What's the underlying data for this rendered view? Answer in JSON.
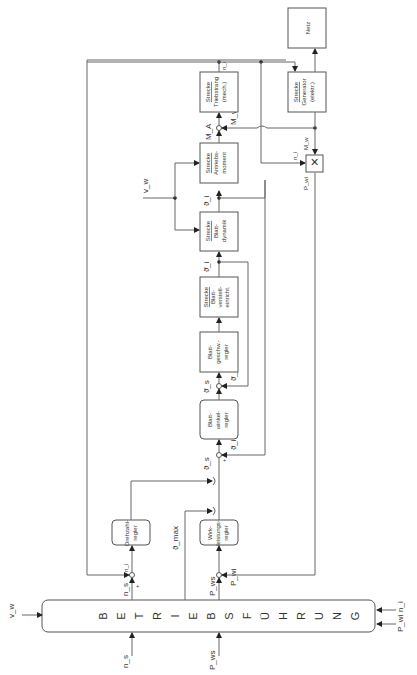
{
  "diagram": {
    "orientation": "rotated 90deg counter-clockwise",
    "operations_block": {
      "letters": [
        "B",
        "E",
        "T",
        "R",
        "I",
        "E",
        "B",
        "S",
        "F",
        "Ü",
        "H",
        "R",
        "U",
        "N",
        "G"
      ],
      "label": "BETRIEBSFÜHRUNG"
    },
    "blocks": {
      "drehzahlregler": [
        "Drehzahl-",
        "regler"
      ],
      "wirkleistungsregler": [
        "Wirk-",
        "leistungs-",
        "regler"
      ],
      "blattwinkelregler": [
        "Blatt-",
        "winkel-",
        "regler"
      ],
      "blattgeschwregler": [
        "Blatt-",
        "geschw.-",
        "regler"
      ],
      "strecke_blattverstell": [
        "Strecke",
        "Blatt-",
        "verstell-",
        "einricht."
      ],
      "strecke_blattdynamik": [
        "Strecke",
        "Blatt-",
        "dynamik"
      ],
      "strecke_antriebsmoment": [
        "Strecke",
        "Antriebs-",
        "moment"
      ],
      "strecke_triebstrang": [
        "Strecke",
        "Triebstrang",
        "(mech.)"
      ],
      "strecke_generator": [
        "Strecke",
        "Generator",
        "(elektr.)"
      ],
      "netz": "Netz",
      "multiplier": "×"
    },
    "signals": {
      "vw_in": "v_w",
      "vw_top": "v_w",
      "ns_bottom": "n_s",
      "ns_top": "n_s",
      "pws_bottom": "P_ws",
      "pws_top": "P_ws",
      "ni_right": "n_i",
      "pwi_right": "P_wi",
      "ni_fb": "n_i",
      "pwi_fb": "P_wi",
      "theta_max": "ϑ_max",
      "theta_s": "ϑ_s",
      "theta_i_1": "ϑ_i",
      "theta_dot_s": "ϑ̇_s",
      "theta_dot_i": "ϑ̇_i",
      "theta_dot_i_2": "ϑ̇_i",
      "theta_i_2": "ϑ_i",
      "ma": "M_A",
      "mw_1": "M_w",
      "mw_2": "M_w",
      "ni_top": "n_i",
      "ni_mult": "n_i",
      "pwi_mult": "P_wi",
      "plus": "+",
      "minus": "−"
    }
  }
}
